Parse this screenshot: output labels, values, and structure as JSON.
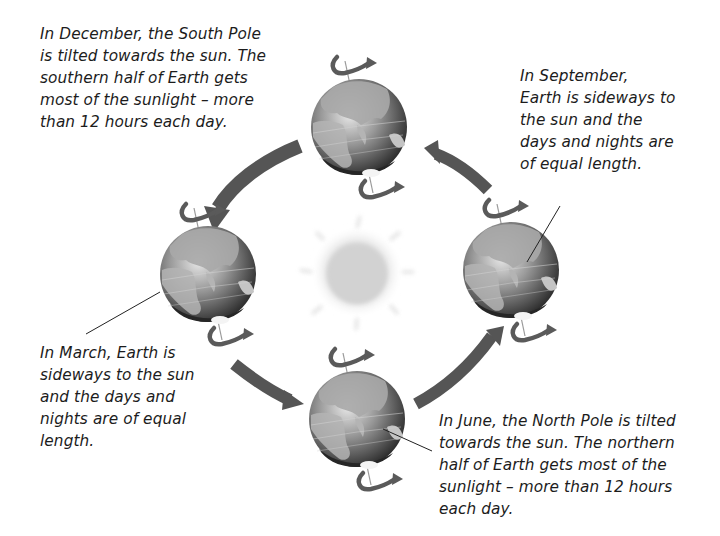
{
  "diagram": {
    "type": "earth-orbit-seasons",
    "center_label": "sun",
    "captions": {
      "december": "In December, the South Pole\nis tilted towards the sun. The\nsouthern half of Earth gets\nmost of the sunlight – more\nthan 12 hours each day.",
      "september": "In September,\nEarth is sideways to\nthe sun and the\ndays and nights are\nof equal length.",
      "march": "In March, Earth is\nsideways to the sun\nand the days and\nnights are of equal\nlength.",
      "june": "In June, the North Pole is tilted\ntowards the sun. The northern\nhalf of Earth gets most of the\nsunlight – more than 12 hours\neach day."
    },
    "positions": [
      {
        "id": "december",
        "position": "top"
      },
      {
        "id": "march",
        "position": "left"
      },
      {
        "id": "june",
        "position": "bottom"
      },
      {
        "id": "september",
        "position": "right"
      }
    ],
    "orbit_direction": "counter-clockwise (top → left → bottom → right → top)",
    "colors": {
      "globe_dark": "#3a3a3a",
      "globe_light": "#bdbdbd",
      "arrow": "#555555",
      "sun": "#d6d6d6",
      "text": "#1c1c1c"
    }
  }
}
